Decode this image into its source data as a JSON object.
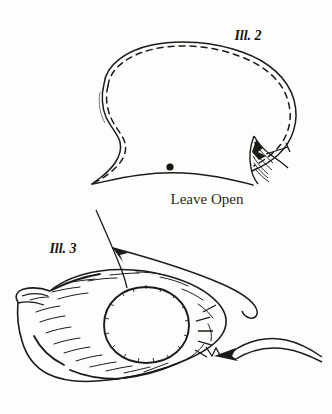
{
  "page": {
    "kind": "scanned-instruction-illustrations",
    "background_color": "#fdfdfb",
    "ink_color": "#1d1b19",
    "width": 332,
    "height": 414
  },
  "figures": [
    {
      "id": "ill-2",
      "label": "Ill. 2",
      "label_x": 248,
      "label_y": 40,
      "description": "kidney-shaped pattern outline with dashed stitching line and pointed tail detail",
      "caption": "Leave Open",
      "caption_x": 207,
      "caption_y": 204,
      "markers": [
        {
          "name": "stitch-stop-dot",
          "x": 170,
          "y": 167,
          "r": 3.6,
          "color": "#14120f"
        }
      ]
    },
    {
      "id": "ill-3",
      "label": "Ill. 3",
      "label_x": 63,
      "label_y": 253,
      "description": "furred body shape with circular gathered opening, needle thread arrow at upper left and thread arrow at right"
    }
  ],
  "annotations": {
    "arrows": [
      {
        "name": "needle-pull-arrow",
        "direction": "up-left",
        "x": 113,
        "y": 248
      },
      {
        "name": "thread-pull-arrow",
        "direction": "left",
        "x": 228,
        "y": 355
      }
    ]
  }
}
